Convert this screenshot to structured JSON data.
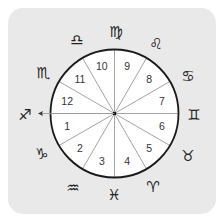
{
  "figure": {
    "colors": {
      "page_background": "#ffffff",
      "panel_background": "#e9e9e9",
      "wheel_fill": "#ffffff",
      "wheel_stroke": "#1a1a1a",
      "divider_stroke": "#9a9a9a",
      "label_color": "#333333",
      "glyph_color": "#222222"
    },
    "wheel": {
      "center": [
        114.5,
        113.5
      ],
      "radius": 64,
      "divisions": 12,
      "label_radius": 49
    },
    "houses": [
      {
        "number": "1",
        "mid_angle_deg": 195
      },
      {
        "number": "2",
        "mid_angle_deg": 225
      },
      {
        "number": "3",
        "mid_angle_deg": 255
      },
      {
        "number": "4",
        "mid_angle_deg": 285
      },
      {
        "number": "5",
        "mid_angle_deg": 315
      },
      {
        "number": "6",
        "mid_angle_deg": 345
      },
      {
        "number": "7",
        "mid_angle_deg": 15
      },
      {
        "number": "8",
        "mid_angle_deg": 45
      },
      {
        "number": "9",
        "mid_angle_deg": 75
      },
      {
        "number": "10",
        "mid_angle_deg": 105
      },
      {
        "number": "11",
        "mid_angle_deg": 135
      },
      {
        "number": "12",
        "mid_angle_deg": 165
      }
    ],
    "signs": [
      {
        "name": "Sagittarius",
        "icon": "sagittarius-icon",
        "glyph": "♐",
        "pos": [
          25,
          114
        ]
      },
      {
        "name": "Capricorn",
        "icon": "capricorn-icon",
        "glyph": "♑",
        "pos": [
          42,
          153
        ]
      },
      {
        "name": "Aquarius",
        "icon": "aquarius-icon",
        "glyph": "♒",
        "pos": [
          73,
          187
        ]
      },
      {
        "name": "Pisces",
        "icon": "pisces-icon",
        "glyph": "♓",
        "pos": [
          114,
          194
        ]
      },
      {
        "name": "Aries",
        "icon": "aries-icon",
        "glyph": "♈",
        "pos": [
          153,
          186
        ]
      },
      {
        "name": "Taurus",
        "icon": "taurus-icon",
        "glyph": "♉",
        "pos": [
          188,
          155
        ]
      },
      {
        "name": "Gemini",
        "icon": "gemini-icon",
        "glyph": "♊",
        "pos": [
          194,
          114
        ]
      },
      {
        "name": "Cancer",
        "icon": "cancer-icon",
        "glyph": "♋",
        "pos": [
          188,
          75
        ]
      },
      {
        "name": "Leo",
        "icon": "leo-icon",
        "glyph": "♌",
        "pos": [
          156,
          43
        ]
      },
      {
        "name": "Virgo",
        "icon": "virgo-icon",
        "glyph": "♍",
        "pos": [
          116,
          31
        ]
      },
      {
        "name": "Libra",
        "icon": "libra-icon",
        "glyph": "♎",
        "pos": [
          77,
          39
        ]
      },
      {
        "name": "Scorpio",
        "icon": "scorpio-icon",
        "glyph": "♏",
        "pos": [
          43,
          72
        ]
      }
    ],
    "ascendant_arrow": {
      "from": [
        114.5,
        113.5
      ],
      "to": [
        38,
        113.5
      ]
    }
  }
}
